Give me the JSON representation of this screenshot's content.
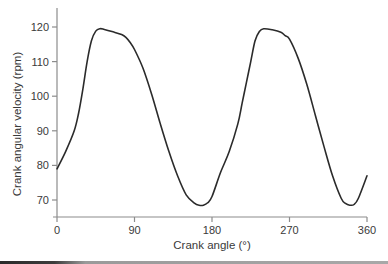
{
  "chart_data": {
    "type": "line",
    "title": "",
    "xlabel": "Crank angle (°)",
    "ylabel": "Crank angular velocity (rpm)",
    "xlim": [
      0,
      360
    ],
    "ylim": [
      65,
      125
    ],
    "grid": false,
    "legend": null,
    "x_ticks": [
      0,
      90,
      180,
      270,
      360
    ],
    "y_ticks": [
      70,
      80,
      90,
      100,
      110,
      120
    ],
    "series": [
      {
        "name": "Crank angular velocity",
        "color": "#2b2b2b",
        "x": [
          0,
          10,
          20,
          25,
          30,
          35,
          40,
          45,
          50,
          55,
          65,
          75,
          80,
          85,
          90,
          100,
          110,
          120,
          130,
          140,
          150,
          160,
          165,
          170,
          175,
          180,
          190,
          200,
          210,
          215,
          220,
          225,
          230,
          235,
          240,
          250,
          260,
          265,
          270,
          280,
          290,
          300,
          310,
          320,
          330,
          335,
          340,
          345,
          350,
          360
        ],
        "values": [
          79,
          84,
          90,
          95,
          102,
          110,
          116,
          118.8,
          119.5,
          119.3,
          118.6,
          117.8,
          117,
          115.5,
          113.5,
          108,
          100.5,
          92,
          84,
          77,
          71.5,
          69,
          68.5,
          68.5,
          69.2,
          71,
          78,
          84,
          92,
          98,
          104,
          110,
          116,
          118.7,
          119.5,
          119.2,
          118.5,
          117.5,
          116.5,
          111,
          103.5,
          94.5,
          85.5,
          77,
          70.5,
          69,
          68.5,
          68.7,
          70.5,
          77
        ]
      }
    ]
  }
}
